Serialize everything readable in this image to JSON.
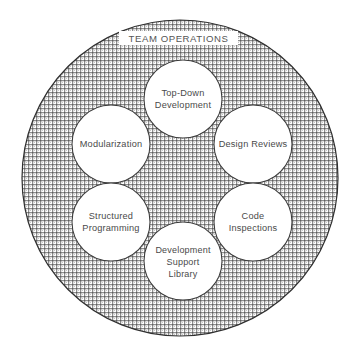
{
  "diagram": {
    "title": "TEAM OPERATIONS",
    "type": "venn-ring",
    "canvas": {
      "width": 357,
      "height": 360,
      "background": "#ffffff"
    },
    "outer": {
      "label": "TEAM OPERATIONS",
      "shape": "circle",
      "cx": 180,
      "cy": 178,
      "r": 158,
      "fill_pattern": "crosshatch-dither",
      "fill_color": "#8a8a8a",
      "stroke_color": "#2f2f2f",
      "label_plate_color": "#ffffff"
    },
    "nodes": [
      {
        "id": "top-down-development",
        "lines": [
          "Top-Down",
          "Development"
        ],
        "cx": 183,
        "cy": 99,
        "r": 39,
        "position": "top"
      },
      {
        "id": "modularization",
        "lines": [
          "Modularization"
        ],
        "cx": 111,
        "cy": 144,
        "r": 39,
        "position": "upper-left"
      },
      {
        "id": "design-reviews",
        "lines": [
          "Design Reviews"
        ],
        "cx": 253,
        "cy": 144,
        "r": 39,
        "position": "upper-right"
      },
      {
        "id": "structured-programming",
        "lines": [
          "Structured",
          "Programming"
        ],
        "cx": 111,
        "cy": 222,
        "r": 39,
        "position": "lower-left"
      },
      {
        "id": "code-inspections",
        "lines": [
          "Code",
          "Inspections"
        ],
        "cx": 253,
        "cy": 222,
        "r": 39,
        "position": "lower-right"
      },
      {
        "id": "development-support-library",
        "lines": [
          "Development",
          "Support",
          "Library"
        ],
        "cx": 183,
        "cy": 261,
        "r": 39,
        "position": "bottom"
      }
    ],
    "colors": {
      "node_fill": "#ffffff",
      "node_stroke": "#3a3a3a",
      "text": "#4a4a4a",
      "title_text": "#555555",
      "hatch": "#7d7d7d"
    }
  }
}
